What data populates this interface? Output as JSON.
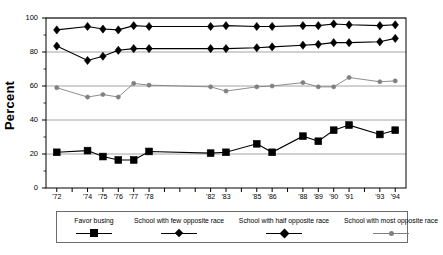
{
  "chart_data": {
    "type": "line",
    "title": "",
    "xlabel": "",
    "ylabel": "Percent",
    "ylim": [
      0,
      100
    ],
    "yticks": [
      0,
      20,
      40,
      60,
      80,
      100
    ],
    "ytick_labels": [
      "0",
      "20",
      "40",
      "60",
      "80",
      "100"
    ],
    "grid": "horizontal-major",
    "legend_position": "below-axes",
    "x": [
      1972,
      1974,
      1975,
      1976,
      1977,
      1978,
      1982,
      1983,
      1985,
      1986,
      1988,
      1989,
      1990,
      1991,
      1993,
      1994
    ],
    "xtick_labels": [
      "'72",
      "'74",
      "'75",
      "'76",
      "'77",
      "'78",
      "'82",
      "'83",
      "'85",
      "'86",
      "'88",
      "'89",
      "'90",
      "'91",
      "'93",
      "'94"
    ],
    "xlim": [
      1971.3,
      1994.7
    ],
    "series": [
      {
        "name": "Favor busing",
        "marker": "square",
        "color": "#000000",
        "values": [
          21,
          22,
          18.5,
          16.5,
          16.5,
          21.5,
          20.5,
          21,
          26,
          21,
          30.5,
          27.5,
          34,
          37,
          31.5,
          34
        ]
      },
      {
        "name": "School with few opposite race",
        "marker": "diamond",
        "color": "#000000",
        "values": [
          83.5,
          75,
          77.5,
          81,
          82,
          82,
          82,
          82,
          82.5,
          83,
          84,
          84.5,
          85.5,
          85.5,
          86,
          88
        ]
      },
      {
        "name": "School with half opposite race",
        "marker": "diamond",
        "color": "#000000",
        "values": [
          93,
          95,
          93.5,
          93,
          95.5,
          95,
          95,
          95.5,
          95,
          95,
          95.5,
          95.5,
          96.5,
          96,
          95.5,
          96
        ]
      },
      {
        "name": "School with most opposite race",
        "marker": "circle",
        "color": "#808080",
        "values": [
          59,
          53.5,
          55,
          53.5,
          61.5,
          60.5,
          59.5,
          57,
          59.5,
          60,
          62,
          59.5,
          59.5,
          65,
          62.5,
          63
        ]
      }
    ]
  },
  "axes": {
    "ylabel": "Percent"
  },
  "legend": {
    "items": [
      {
        "label": "Favor busing",
        "marker": "square",
        "color": "#000000"
      },
      {
        "label": "School with few opposite race",
        "marker": "diamond",
        "color": "#000000"
      },
      {
        "label": "School with half opposite race",
        "marker": "diamond-large",
        "color": "#000000"
      },
      {
        "label": "School with most opposite race",
        "marker": "circle",
        "color": "#808080"
      }
    ]
  }
}
